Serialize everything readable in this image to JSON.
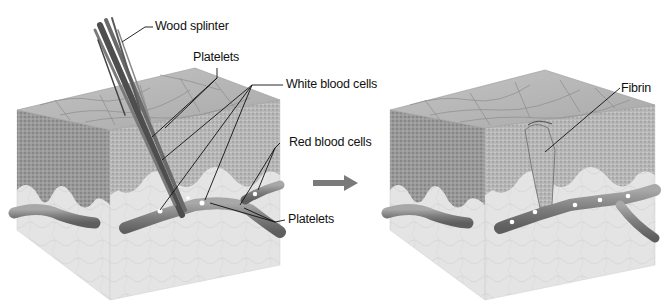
{
  "figure": {
    "panels": [
      {
        "id": "before",
        "description": "Skin cross-section block pierced by a wood splinter",
        "labels": {
          "wood_splinter": "Wood splinter",
          "platelets_top": "Platelets",
          "white_blood_cells": "White blood cells",
          "red_blood_cells": "Red blood cells",
          "platelets_bottom": "Platelets"
        }
      },
      {
        "id": "after",
        "description": "Skin cross-section block with fibrin clot sealing the wound",
        "labels": {
          "fibrin": "Fibrin"
        }
      }
    ],
    "arrow": {
      "direction": "right",
      "color": "#7a7a7a"
    },
    "colors": {
      "skin_top": "#b9b9b9",
      "epidermis": "#8a8a8a",
      "dermis": "#e3e3e3",
      "vessel": "#8c8c8c",
      "splinter": "#5a5a5a",
      "leader_line": "#111111"
    }
  }
}
